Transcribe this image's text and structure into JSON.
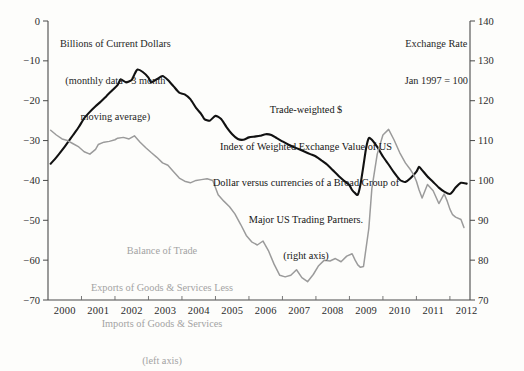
{
  "chart_data": {
    "type": "line",
    "title": "",
    "xlabel": "",
    "ylabel": "Billions of Current Dollars",
    "y2label": "Exchange Rate",
    "grid": false,
    "legend_position": "inline-annotations",
    "xlim": [
      1999.5,
      2012.1
    ],
    "ylim": [
      -70,
      0
    ],
    "y2lim": [
      70,
      140
    ],
    "x_ticks": [
      2000,
      2001,
      2002,
      2003,
      2004,
      2005,
      2006,
      2007,
      2008,
      2009,
      2010,
      2011,
      2012
    ],
    "x_ticklabels": [
      "2000",
      "2001",
      "2002",
      "2003",
      "2004",
      "2005",
      "2006",
      "2007",
      "2008",
      "2009",
      "2010",
      "2011",
      "2012"
    ],
    "y_ticks": [
      0,
      -10,
      -20,
      -30,
      -40,
      -50,
      -60,
      -70
    ],
    "y_ticklabels": [
      "0",
      "−10",
      "−20",
      "−30",
      "−40",
      "−50",
      "−60",
      "−70"
    ],
    "y2_ticks": [
      140,
      130,
      120,
      110,
      100,
      90,
      80,
      70
    ],
    "y2_ticklabels": [
      "140",
      "130",
      "120",
      "110",
      "100",
      "90",
      "80",
      "70"
    ],
    "series": [
      {
        "name": "Trade-weighted $ Index of Weighted Exchange Value of US Dollar",
        "axis": "right",
        "color": "#111111",
        "x": [
          1999.58,
          1999.75,
          1999.92,
          2000.08,
          2000.25,
          2000.42,
          2000.58,
          2000.75,
          2000.92,
          2001.08,
          2001.25,
          2001.42,
          2001.58,
          2001.67,
          2001.83,
          2002.0,
          2002.08,
          2002.17,
          2002.33,
          2002.5,
          2002.58,
          2002.75,
          2002.92,
          2003.08,
          2003.25,
          2003.42,
          2003.58,
          2003.75,
          2003.92,
          2004.08,
          2004.17,
          2004.33,
          2004.5,
          2004.67,
          2004.83,
          2005.0,
          2005.17,
          2005.33,
          2005.5,
          2005.67,
          2005.83,
          2006.0,
          2006.17,
          2006.33,
          2006.5,
          2006.67,
          2006.83,
          2007.0,
          2007.17,
          2007.33,
          2007.5,
          2007.67,
          2007.83,
          2008.0,
          2008.17,
          2008.33,
          2008.5,
          2008.58,
          2008.67,
          2008.75,
          2008.83,
          2008.92,
          2009.0,
          2009.08,
          2009.17,
          2009.33,
          2009.5,
          2009.67,
          2009.83,
          2010.0,
          2010.08,
          2010.17,
          2010.33,
          2010.5,
          2010.58,
          2010.67,
          2010.83,
          2011.0,
          2011.17,
          2011.33,
          2011.5,
          2011.58,
          2011.67,
          2011.83,
          2012.0
        ],
        "values": [
          104.2,
          105.8,
          107.6,
          109.4,
          111.4,
          113.4,
          115.6,
          117.2,
          118.6,
          119.8,
          121.2,
          122.6,
          124.0,
          125.4,
          124.6,
          125.2,
          126.6,
          127.8,
          127.2,
          125.8,
          124.6,
          125.4,
          126.2,
          125.2,
          123.6,
          122.0,
          121.6,
          120.4,
          118.2,
          116.6,
          115.4,
          115.0,
          116.2,
          115.4,
          113.4,
          111.6,
          110.4,
          110.2,
          110.8,
          111.0,
          111.2,
          111.6,
          111.4,
          110.6,
          109.8,
          109.0,
          108.4,
          107.8,
          107.2,
          106.6,
          106.0,
          105.0,
          104.0,
          102.6,
          101.2,
          100.0,
          98.8,
          97.6,
          96.8,
          96.4,
          99.0,
          103.8,
          108.2,
          110.6,
          110.2,
          108.4,
          106.0,
          104.0,
          102.0,
          100.2,
          99.8,
          99.6,
          100.6,
          102.2,
          103.4,
          102.6,
          101.0,
          99.6,
          98.2,
          97.2,
          96.6,
          97.2,
          98.2,
          99.4,
          99.2
        ]
      },
      {
        "name": "Balance of Trade: Exports of Goods & Services Less Imports of Goods & Services",
        "axis": "left",
        "color": "#9b9b9b",
        "x": [
          1999.58,
          1999.75,
          1999.92,
          2000.08,
          2000.25,
          2000.42,
          2000.58,
          2000.75,
          2000.92,
          2001.0,
          2001.17,
          2001.33,
          2001.5,
          2001.58,
          2001.75,
          2001.92,
          2002.08,
          2002.25,
          2002.42,
          2002.58,
          2002.75,
          2002.92,
          2003.08,
          2003.25,
          2003.42,
          2003.58,
          2003.75,
          2003.92,
          2004.08,
          2004.25,
          2004.42,
          2004.58,
          2004.75,
          2004.92,
          2005.08,
          2005.25,
          2005.42,
          2005.58,
          2005.75,
          2005.92,
          2006.08,
          2006.25,
          2006.42,
          2006.58,
          2006.75,
          2006.92,
          2007.08,
          2007.25,
          2007.42,
          2007.58,
          2007.75,
          2007.92,
          2008.08,
          2008.25,
          2008.42,
          2008.58,
          2008.67,
          2008.75,
          2008.83,
          2008.92,
          2009.08,
          2009.17,
          2009.33,
          2009.5,
          2009.67,
          2009.83,
          2010.0,
          2010.17,
          2010.33,
          2010.42,
          2010.5,
          2010.58,
          2010.67,
          2010.83,
          2011.0,
          2011.17,
          2011.33,
          2011.42,
          2011.5,
          2011.58,
          2011.67,
          2011.83,
          2011.92
        ],
        "values": [
          -27.4,
          -28.6,
          -29.6,
          -30.0,
          -30.8,
          -31.6,
          -32.8,
          -33.4,
          -32.2,
          -31.0,
          -30.4,
          -30.2,
          -29.8,
          -29.4,
          -29.2,
          -29.6,
          -28.8,
          -30.4,
          -31.8,
          -33.0,
          -34.2,
          -35.6,
          -36.2,
          -37.8,
          -39.4,
          -40.2,
          -40.6,
          -40.0,
          -39.8,
          -39.6,
          -40.0,
          -43.6,
          -45.2,
          -46.6,
          -48.4,
          -51.0,
          -53.8,
          -55.4,
          -56.2,
          -55.2,
          -57.6,
          -61.0,
          -63.8,
          -64.2,
          -63.8,
          -62.4,
          -64.4,
          -65.4,
          -63.6,
          -61.4,
          -60.0,
          -60.2,
          -59.6,
          -60.4,
          -59.0,
          -58.4,
          -60.0,
          -61.2,
          -61.8,
          -61.6,
          -52.0,
          -42.0,
          -33.4,
          -28.6,
          -27.2,
          -29.8,
          -33.0,
          -35.6,
          -37.4,
          -38.6,
          -40.2,
          -42.4,
          -44.4,
          -41.0,
          -42.6,
          -45.8,
          -43.4,
          -45.2,
          -47.2,
          -48.6,
          -49.2,
          -49.8,
          -51.8
        ]
      }
    ],
    "annotations": {
      "left_header": {
        "line1": "Billions of Current Dollars",
        "line2": "(monthly data - 3 month",
        "line3": "moving average)"
      },
      "right_header": {
        "line1": "Exchange Rate",
        "line2": "Jan 1997 = 100"
      },
      "black_series_label": {
        "line1": "Trade-weighted $",
        "line2": "Index of Weighted Exchange Value of US",
        "line3": "Dollar versus currencies of a Broad Group of",
        "line4": "Major US Trading Partners.",
        "line5": "(right axis)"
      },
      "gray_series_label": {
        "line1": "Balance of Trade",
        "line2": "Exports of Goods & Services Less",
        "line3": "Imports of Goods & Services",
        "line4": "(left axis)"
      }
    },
    "colors": {
      "background": "#fdfdfb",
      "black_line": "#111111",
      "gray_line": "#9b9b9b",
      "axis": "#4a4a4a",
      "text": "#1a1a1a"
    }
  }
}
